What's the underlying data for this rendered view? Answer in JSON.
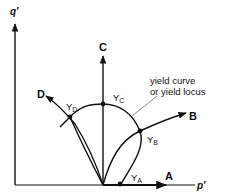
{
  "diagram": {
    "axes": {
      "y_label": "q′",
      "x_label": "p′"
    },
    "paths": [
      {
        "id": "A",
        "label": "A"
      },
      {
        "id": "B",
        "label": "B"
      },
      {
        "id": "C",
        "label": "C"
      },
      {
        "id": "D",
        "label": "D"
      }
    ],
    "yield_points": [
      {
        "id": "YA",
        "main": "Y",
        "sub": "A"
      },
      {
        "id": "YB",
        "main": "Y",
        "sub": "B"
      },
      {
        "id": "YC",
        "main": "Y",
        "sub": "C"
      },
      {
        "id": "YD",
        "main": "Y",
        "sub": "D"
      }
    ],
    "annotation": {
      "line1": "yield curve",
      "line2": "or yield locus"
    },
    "colors": {
      "ink": "#111111",
      "background": "#ffffff"
    }
  }
}
